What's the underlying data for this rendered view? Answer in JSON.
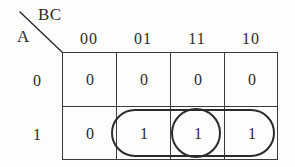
{
  "diagram": {
    "type": "karnaugh-map",
    "corner": {
      "column_variables": "BC",
      "row_variable": "A",
      "divider": "diagonal-line"
    },
    "column_headers": [
      "00",
      "01",
      "11",
      "10"
    ],
    "row_headers": [
      "0",
      "1"
    ],
    "cells": [
      {
        "row": "0",
        "col": "00",
        "value": "0"
      },
      {
        "row": "0",
        "col": "01",
        "value": "0"
      },
      {
        "row": "0",
        "col": "11",
        "value": "0"
      },
      {
        "row": "0",
        "col": "10",
        "value": "0"
      },
      {
        "row": "1",
        "col": "00",
        "value": "0"
      },
      {
        "row": "1",
        "col": "01",
        "value": "1"
      },
      {
        "row": "1",
        "col": "11",
        "value": "1"
      },
      {
        "row": "1",
        "col": "10",
        "value": "1"
      }
    ],
    "groups": [
      {
        "name": "group-pill-row1-cols-01-11-10",
        "shape": "stadium",
        "row": "1",
        "columns": [
          "01",
          "11",
          "10"
        ],
        "cell_count": 3
      },
      {
        "name": "group-circle-row1-col-11",
        "shape": "circle",
        "row": "1",
        "columns": [
          "11"
        ],
        "cell_count": 1
      }
    ],
    "colors": {
      "ink": "#2b2b2b",
      "grid_line": "#3a3a3a",
      "background": "#fdfdfc"
    }
  }
}
